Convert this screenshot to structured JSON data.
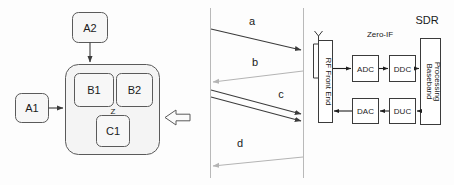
{
  "figure": {
    "title_visible": false,
    "colors": {
      "stroke_dark": "#3b3b3b",
      "stroke_light": "#b4b4b4",
      "text": "#1a1a1a",
      "background": "#fdfdfd",
      "box_fill": "#ffffff",
      "container_fill": "#f4f4f4"
    }
  },
  "left_diagram": {
    "name": "nested-component-diagram",
    "external_boxes": [
      {
        "id": "a1",
        "label": "A1"
      },
      {
        "id": "a2",
        "label": "A2"
      }
    ],
    "container": {
      "id": "container",
      "label": "",
      "inner_boxes": [
        {
          "id": "b1",
          "label": "B1"
        },
        {
          "id": "b2",
          "label": "B2"
        },
        {
          "id": "c1",
          "label": "C1"
        }
      ],
      "junction_label": "Z"
    },
    "arrows": [
      {
        "id": "a1-to-container",
        "from": "A1",
        "to": "container",
        "direction": "right",
        "style": "solid-filled"
      },
      {
        "id": "a2-to-container",
        "from": "A2",
        "to": "container",
        "direction": "down",
        "style": "solid-filled"
      },
      {
        "id": "external-into-container",
        "from": "",
        "to": "container",
        "direction": "left",
        "style": "hollow-block"
      }
    ]
  },
  "sequence_diagram": {
    "name": "message-sequence-diagram",
    "lifelines": [
      {
        "id": "lifeline-left",
        "label": ""
      },
      {
        "id": "lifeline-right",
        "label": ""
      }
    ],
    "messages": [
      {
        "id": "msg-a",
        "label": "a",
        "direction": "right",
        "tone": "dark"
      },
      {
        "id": "msg-b",
        "label": "b",
        "direction": "left",
        "tone": "light"
      },
      {
        "id": "msg-c",
        "label": "c",
        "direction": "right",
        "tone": "dark",
        "count": 2
      },
      {
        "id": "msg-d",
        "label": "d",
        "direction": "left",
        "tone": "light"
      }
    ]
  },
  "sdr_diagram": {
    "name": "sdr-block-diagram",
    "group_label": "SDR",
    "architecture_label": "Zero-IF",
    "antenna": {
      "id": "antenna",
      "label": ""
    },
    "blocks": [
      {
        "id": "rf-front-end",
        "label": "RF Front End",
        "orientation": "vertical"
      },
      {
        "id": "adc",
        "label": "ADC",
        "orientation": "horizontal"
      },
      {
        "id": "ddc",
        "label": "DDC",
        "orientation": "horizontal"
      },
      {
        "id": "baseband-processing",
        "label": "Baseband\nProcessing",
        "label_line1": "Baseband",
        "label_line2": "Processing",
        "orientation": "vertical"
      },
      {
        "id": "dac",
        "label": "DAC",
        "orientation": "horizontal"
      },
      {
        "id": "duc",
        "label": "DUC",
        "orientation": "horizontal"
      }
    ],
    "receive_chain": [
      "rf-front-end",
      "adc",
      "ddc",
      "baseband-processing"
    ],
    "transmit_chain": [
      "baseband-processing",
      "duc",
      "dac",
      "rf-front-end"
    ]
  }
}
